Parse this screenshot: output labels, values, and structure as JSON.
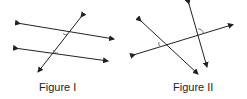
{
  "figures": [
    {
      "label": "Figure I",
      "description": "Two parallel lines cut by a transversal with marked angles"
    },
    {
      "label": "Figure II",
      "description": "Three intersecting lines with marked angles"
    }
  ],
  "colors": {
    "line": "#222222",
    "arc": "#555555",
    "background": "#ffffff"
  }
}
